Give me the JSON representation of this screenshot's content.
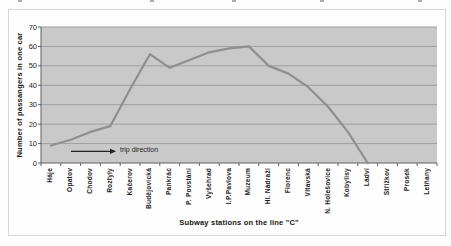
{
  "colors": {
    "plot_background": "#c9c9c9",
    "gridline": "#9f9f9f",
    "axis": "#5f5f5f",
    "series_line": "#8f8f8f",
    "annotation_arrow": "#222222",
    "text": "#1c1c1c"
  },
  "chart_data": {
    "type": "line",
    "title": "",
    "xlabel": "Subway stations on the line  \"C\"",
    "ylabel": "Number of passangers in one car",
    "ylim": [
      0,
      70
    ],
    "yticks": [
      0,
      10,
      20,
      30,
      40,
      50,
      60,
      70
    ],
    "grid": true,
    "legend": "none",
    "categories": [
      "Háje",
      "Opatov",
      "Chodov",
      "Roztyly",
      "Kačerov",
      "Budějovická",
      "Pankrác",
      "P. Povstání",
      "Vyšehrad",
      "I.P.Pavlova",
      "Muzeum",
      "Hl. Nádraží",
      "Florenc",
      "Vltavská",
      "N. Holešovice",
      "Kobylisy",
      "Ládví",
      "Střížkov",
      "Prosek",
      "Letňany"
    ],
    "series": [
      {
        "name": "passengers-in-one-car",
        "values": [
          9,
          12,
          16,
          19,
          38,
          56,
          49,
          53,
          57,
          59,
          60,
          50,
          46,
          39,
          29,
          16,
          0,
          null,
          null,
          null
        ]
      }
    ],
    "annotation": {
      "text": "trip direction",
      "arrow_from_px": 30,
      "arrow_to_px": 75,
      "y_value": 6
    }
  }
}
